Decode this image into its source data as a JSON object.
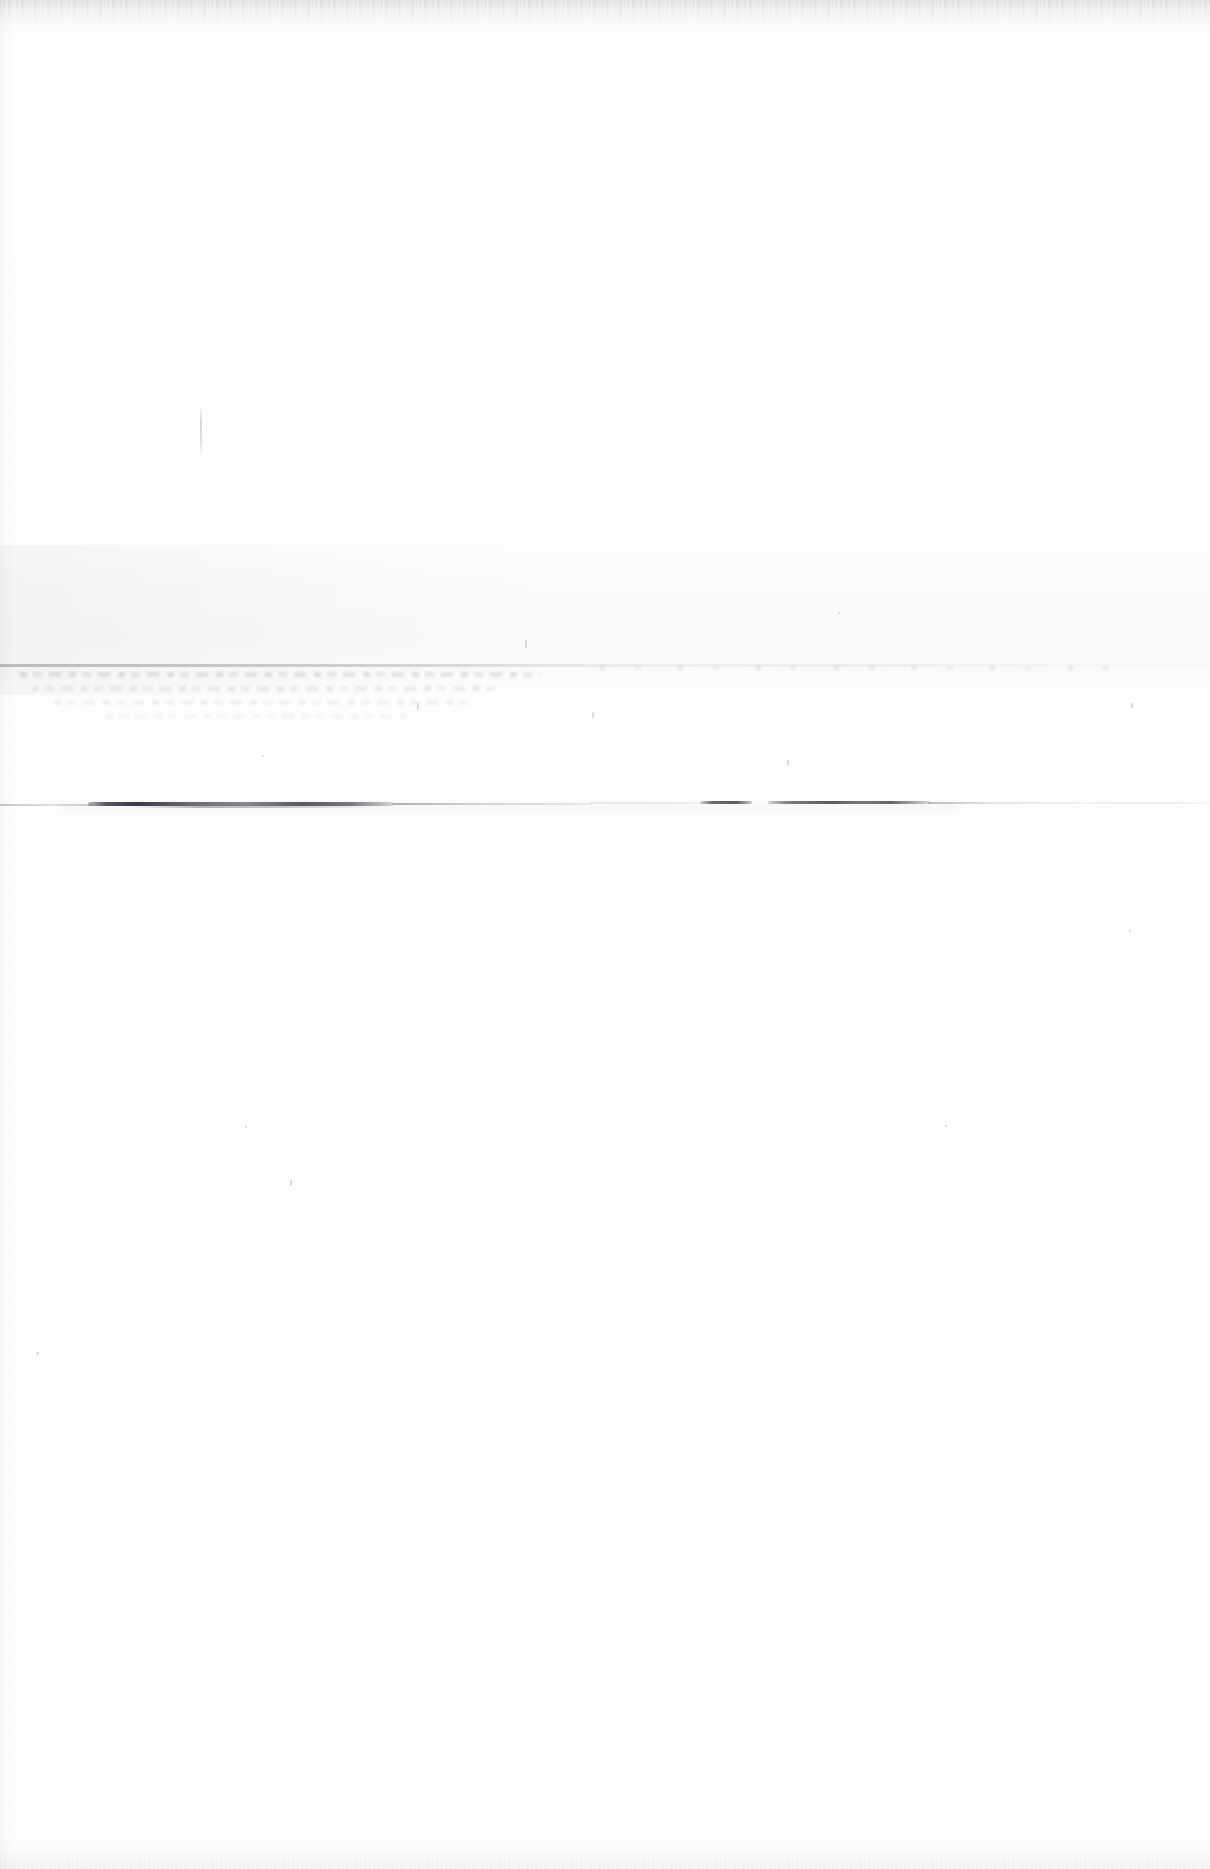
{
  "document": {
    "kind": "scanned-page",
    "title": "Scanned document page",
    "description": "Near-blank scanned sheet of paper. No legible printed or handwritten text is present.",
    "page_width": 1210,
    "page_height": 1869,
    "orientation": "portrait",
    "text_content": "",
    "legible_text_present": "no"
  },
  "colors": {
    "paper": "#ffffff",
    "paper_shadow": "#fbfbfc",
    "ink_dark": "#2c2e36",
    "ink_mid": "#4a4c54",
    "ink_faint": "#6e7179",
    "rule_gray": "#3c3e46"
  },
  "artifacts": {
    "ink_line": {
      "name": "horizontal-ink-line",
      "top": 805,
      "left": 0,
      "right": 1210,
      "note": "Dark wavy horizontal stroke crossing the sheet; heaviest between x 90 and x 390, broken dashes near x 700-930, faint trailing tail to the right edge."
    },
    "faint_rule": {
      "name": "faint-horizontal-rule",
      "top": 665,
      "note": "Very light gray rule spanning the full width, strongest on the left side."
    },
    "tone_band": {
      "name": "tonal-band",
      "top": 545,
      "height": 145,
      "note": "Broad, very faint gray tonal wash across the middle of the page, darker toward the left."
    },
    "ghost_text": {
      "name": "ghost-text-bleed",
      "top": 672,
      "left": 10,
      "width": 560,
      "rows": 4,
      "note": "Illegible show-through marks resembling four lines of text beneath the faint rule; not readable."
    },
    "scan_streak": {
      "name": "vertical-scan-streak",
      "top": 405,
      "left": 200,
      "note": "Short faint vertical scanner streak in the upper half of the page."
    },
    "edges": {
      "top_note": "Darker ragged scanner edge along the top of the sheet.",
      "bottom_note": "Slight darkening along the bottom edge of the sheet.",
      "left_note": "Thin darker band along the left edge of the sheet."
    }
  }
}
